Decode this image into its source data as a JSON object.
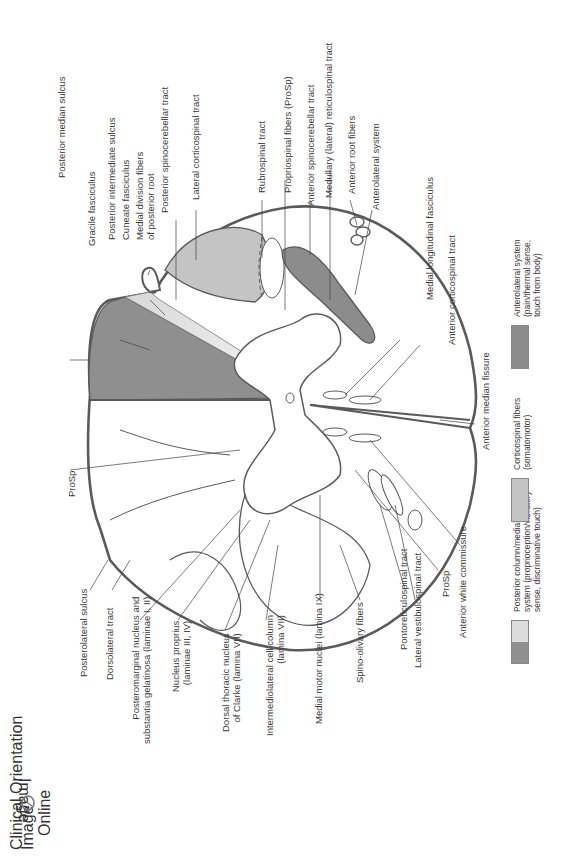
{
  "figure": {
    "orientation": "rotated -90deg",
    "colors": {
      "outline": "#5a5a5a",
      "posterior_column_dark": "#8f8f8f",
      "posterior_column_light": "#dcdcdc",
      "corticospinal": "#c4c4c4",
      "anterolateral": "#8c8c8c",
      "white": "#ffffff"
    }
  },
  "labels": {
    "top": [
      {
        "id": "posterior-median-sulcus",
        "text": "Posterior median sulcus"
      },
      {
        "id": "gracile-fasciculus",
        "text": "Gracile fasciculus"
      },
      {
        "id": "posterior-intermediate-sulcus",
        "text": "Posterior intermediate sulcus"
      },
      {
        "id": "cuneate-fasciculus",
        "text": "Cuneate fasciculus"
      },
      {
        "id": "medial-division-fibers",
        "text": "Medial division fibers\nof posterior root"
      },
      {
        "id": "posterior-spinocerebellar-tract",
        "text": "Posterior spinocerebellar tract"
      },
      {
        "id": "lateral-corticospinal-tract",
        "text": "Lateral corticospinal tract"
      },
      {
        "id": "rubrospinal-tract",
        "text": "Rubrospinal tract"
      },
      {
        "id": "propriospinal-fibers",
        "text": "Propriospinal fibers (ProSp)"
      },
      {
        "id": "anterior-spinocerebellar-tract",
        "text": "Anterior spinocerebellar tract"
      },
      {
        "id": "medullary-reticulospinal-tract",
        "text": "Medullary (lateral) reticulospinal tract"
      },
      {
        "id": "anterior-root-fibers",
        "text": "Anterior root fibers"
      },
      {
        "id": "anterolateral-system",
        "text": "Anterolateral system"
      },
      {
        "id": "medial-longitudinal-fasciculus",
        "text": "Medial longitudinal fasciculus"
      },
      {
        "id": "anterior-corticospinal-tract",
        "text": "Anterior corticospinal tract"
      },
      {
        "id": "anterior-median-fissure",
        "text": "Anterior median fissure"
      }
    ],
    "bottom": [
      {
        "id": "prosp-left",
        "text": "ProSp"
      },
      {
        "id": "posterolateral-sulcus",
        "text": "Posterolateral sulcus"
      },
      {
        "id": "dorsolateral-tract",
        "text": "Dorsolateral tract"
      },
      {
        "id": "posteromarginal-nucleus",
        "text": "Posteromarginal nucleus and\nsubstantia gelatinosa (laminae I, II)"
      },
      {
        "id": "nucleus-proprius",
        "text": "Nucleus proprius\n(laminae III, IV)"
      },
      {
        "id": "dorsal-thoracic-nucleus",
        "text": "Dorsal thoracic nucleus\nof Clarke (lamina VII)"
      },
      {
        "id": "intermediolateral-cell-column",
        "text": "Intermediolateral cell column\n(lamina VII)"
      },
      {
        "id": "medial-motor-nuclei",
        "text": "Medial motor nuclei (lamina IX)"
      },
      {
        "id": "spino-olivary-fibers",
        "text": "Spino-olivary fibers"
      },
      {
        "id": "pontoreticulospinal-tract",
        "text": "Pontoreticulospinal tract"
      },
      {
        "id": "lateral-vestibulospinal-tract",
        "text": "Lateral vestibulospinal tract"
      },
      {
        "id": "prosp-right",
        "text": "ProSp"
      },
      {
        "id": "anterior-white-commissure",
        "text": "Anterior white commissure"
      }
    ]
  },
  "legend": [
    {
      "id": "posterior-column",
      "text": "Posterior column/medial lemniscus\nsystem (proprioception/vibratory\nsense, discriminative touch)",
      "colors": [
        "#dcdcdc",
        "#8f8f8f"
      ]
    },
    {
      "id": "corticospinal",
      "text": "Corticospinal fibers\n(somatomotor)",
      "colors": [
        "#c4c4c4"
      ]
    },
    {
      "id": "anterolateral",
      "text": "Anterolateral system\n(pain/thermal sense,\ntouch from body)",
      "colors": [
        "#8c8c8c"
      ]
    }
  ],
  "logo": {
    "line1": "Clinical Orientation",
    "line2": "Image",
    "line2_mirrored": "Image",
    "line3": "Online"
  }
}
